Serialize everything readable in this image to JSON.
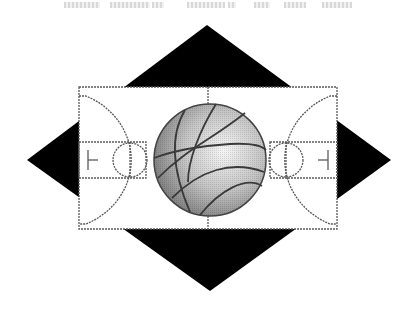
{
  "logo": {
    "description": "Basketball court over black diamond with basketball at center court",
    "colors": {
      "diamond": "#000000",
      "court_lines": "#555555",
      "court_fill": "#ffffff",
      "ball_light": "#f4f4f4",
      "ball_dark": "#8a8a8a",
      "ball_seams": "#3a3a3a"
    },
    "icons": [
      "diamond-shape",
      "basketball-court",
      "basketball-icon"
    ]
  },
  "header_text": {
    "visible": "cut off / illegible"
  }
}
